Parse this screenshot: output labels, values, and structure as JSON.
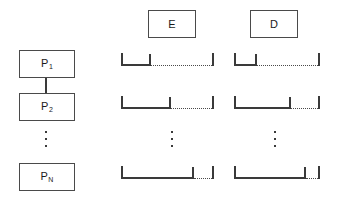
{
  "diagram": {
    "background": "#ffffff",
    "stroke_color": "#3a3a3a",
    "box_border_color": "#4a4a4a",
    "text_color": "#1a1a1a",
    "width": 338,
    "height": 204
  },
  "column_headers": [
    {
      "id": "E",
      "label": "E",
      "x": 148,
      "y": 10,
      "w": 48,
      "h": 28
    },
    {
      "id": "D",
      "label": "D",
      "x": 250,
      "y": 10,
      "w": 48,
      "h": 28
    }
  ],
  "processes": [
    {
      "id": "P1",
      "label": "P",
      "subscript": "1",
      "x": 19,
      "y": 50,
      "w": 56,
      "h": 28
    },
    {
      "id": "P2",
      "label": "P",
      "subscript": "2",
      "x": 19,
      "y": 93,
      "w": 56,
      "h": 28
    },
    {
      "id": "PN",
      "label": "P",
      "subscript": "N",
      "x": 19,
      "y": 163,
      "w": 56,
      "h": 28
    }
  ],
  "connector": {
    "x": 46,
    "y": 78,
    "h": 15
  },
  "ellipses": [
    {
      "id": "process-ellipsis",
      "x": 46,
      "y": 131,
      "h": 16
    },
    {
      "id": "e-column-ellipsis",
      "x": 172,
      "y": 131,
      "h": 16
    },
    {
      "id": "d-column-ellipsis",
      "x": 275,
      "y": 131,
      "h": 16
    }
  ],
  "intervals": [
    {
      "id": "E-P1",
      "column": "E",
      "process": "P1",
      "x": 121,
      "y": 53,
      "solid_width": 28,
      "dotted_width": 63,
      "has_mid_tick": true
    },
    {
      "id": "E-P2",
      "column": "E",
      "process": "P2",
      "x": 121,
      "y": 96,
      "solid_width": 48,
      "dotted_width": 43,
      "has_mid_tick": true
    },
    {
      "id": "E-PN",
      "column": "E",
      "process": "PN",
      "x": 121,
      "y": 166,
      "solid_width": 71,
      "dotted_width": 20,
      "has_mid_tick": true
    },
    {
      "id": "D-P1",
      "column": "D",
      "process": "P1",
      "x": 234,
      "y": 53,
      "solid_width": 21,
      "dotted_width": 63,
      "has_mid_tick": true
    },
    {
      "id": "D-P2",
      "column": "D",
      "process": "P2",
      "x": 234,
      "y": 96,
      "solid_width": 55,
      "dotted_width": 29,
      "has_mid_tick": true
    },
    {
      "id": "D-PN",
      "column": "D",
      "process": "PN",
      "x": 234,
      "y": 166,
      "solid_width": 70,
      "dotted_width": 14,
      "has_mid_tick": true
    }
  ]
}
